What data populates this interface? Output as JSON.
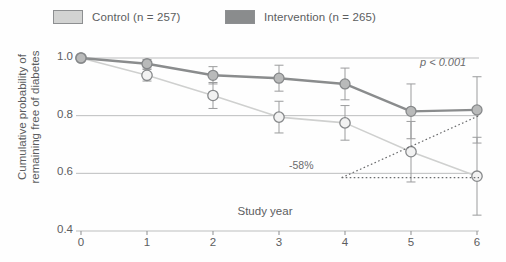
{
  "legend": {
    "control": {
      "label": "Control (n = 257)",
      "color": "#d2d3d2",
      "icon": "legend-swatch"
    },
    "intervention": {
      "label": "Intervention (n = 265)",
      "color": "#8a8c8d",
      "icon": "legend-swatch"
    }
  },
  "annotations": {
    "pvalue": "p < 0.001",
    "reduction": "-58%"
  },
  "chart_data": {
    "type": "line",
    "title": "",
    "xlabel": "Study year",
    "ylabel": "Cumulative probability of remaining free of diabetes",
    "x": [
      0,
      1,
      2,
      3,
      4,
      5,
      6
    ],
    "xticklabels": [
      "0",
      "1",
      "2",
      "3",
      "4",
      "5",
      "6"
    ],
    "xlim": [
      0,
      6
    ],
    "ylim": [
      0.4,
      1.0
    ],
    "yticklabels": [
      "1.0",
      "0.8",
      "0.6",
      "0.4"
    ],
    "yticks": [
      1.0,
      0.8,
      0.6,
      0.4
    ],
    "grid": "horizontal",
    "legend_position": "top",
    "series": [
      {
        "name": "Intervention (n = 265)",
        "color": "#8a8c8d",
        "marker": "filled-circle",
        "values": [
          1.0,
          0.98,
          0.94,
          0.93,
          0.91,
          0.815,
          0.82
        ],
        "err_low": [
          0.0,
          0.015,
          0.03,
          0.045,
          0.055,
          0.095,
          0.115
        ],
        "err_high": [
          0.0,
          0.015,
          0.03,
          0.045,
          0.055,
          0.095,
          0.115
        ]
      },
      {
        "name": "Control (n = 257)",
        "color": "#cfd0cf",
        "marker": "open-circle",
        "values": [
          1.0,
          0.94,
          0.87,
          0.795,
          0.775,
          0.675,
          0.59
        ],
        "err_low": [
          0.0,
          0.02,
          0.045,
          0.055,
          0.06,
          0.105,
          0.135
        ],
        "err_high": [
          0.0,
          0.02,
          0.045,
          0.055,
          0.06,
          0.105,
          0.135
        ]
      }
    ],
    "annotations": [
      {
        "text": "p < 0.001",
        "x": 5.6,
        "y": 0.955
      },
      {
        "text": "-58%",
        "x": 3.85,
        "y": 0.585,
        "style": "dotted-leader"
      }
    ]
  }
}
